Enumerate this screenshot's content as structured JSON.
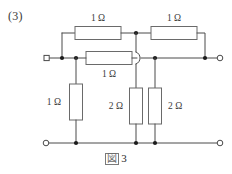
{
  "problem": {
    "number_label": "(3)"
  },
  "caption": {
    "figure_glyph": "図",
    "figure_number": "3",
    "full_text": "図 3"
  },
  "diagram": {
    "line_color": "#4a4a4a",
    "component_outline_color": "#6a6a6a",
    "node_color": "#1b1b1b",
    "background": "#ffffff"
  },
  "resistors": [
    {
      "id": "r-top-left",
      "value": "1 Ω",
      "orientation": "horizontal",
      "label_position": "above"
    },
    {
      "id": "r-top-right",
      "value": "1 Ω",
      "orientation": "horizontal",
      "label_position": "above"
    },
    {
      "id": "r-middle",
      "value": "1 Ω",
      "orientation": "horizontal",
      "label_position": "below"
    },
    {
      "id": "r-shunt-left",
      "value": "1 Ω",
      "orientation": "vertical",
      "label_position": "left"
    },
    {
      "id": "r-shunt-mid",
      "value": "2 Ω",
      "orientation": "vertical",
      "label_position": "left"
    },
    {
      "id": "r-shunt-right",
      "value": "2 Ω",
      "orientation": "vertical",
      "label_position": "right"
    }
  ],
  "terminals": [
    {
      "id": "terminal-left",
      "shape": "open-square"
    },
    {
      "id": "terminal-right",
      "shape": "open-circle"
    },
    {
      "id": "terminal-bottom-left",
      "shape": "open-circle"
    },
    {
      "id": "terminal-bottom-right",
      "shape": "open-circle"
    }
  ],
  "wire_crossing": {
    "id": "wire-hop",
    "style": "semicircular-hop",
    "meaning": "no-connection"
  }
}
